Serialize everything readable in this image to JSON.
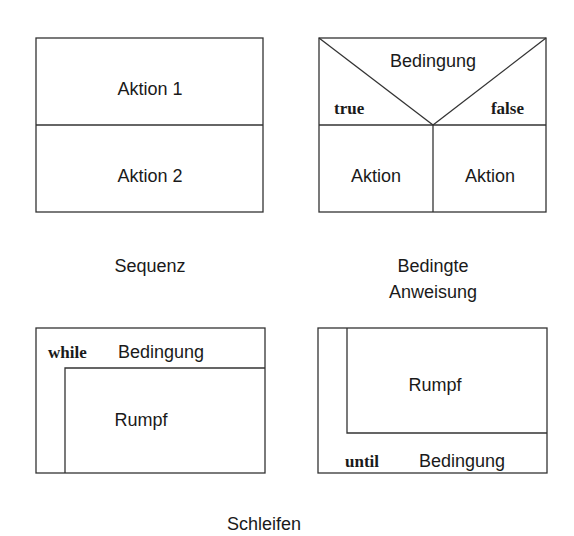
{
  "diagram": {
    "sequence": {
      "action1": "Aktion 1",
      "action2": "Aktion 2",
      "caption": "Sequenz"
    },
    "conditional": {
      "condition": "Bedingung",
      "true_label": "true",
      "false_label": "false",
      "action_left": "Aktion",
      "action_right": "Aktion",
      "caption_line1": "Bedingte",
      "caption_line2": "Anweisung"
    },
    "while_loop": {
      "keyword": "while",
      "condition": "Bedingung",
      "body": "Rumpf"
    },
    "until_loop": {
      "keyword": "until",
      "condition": "Bedingung",
      "body": "Rumpf"
    },
    "loops_caption": "Schleifen"
  }
}
